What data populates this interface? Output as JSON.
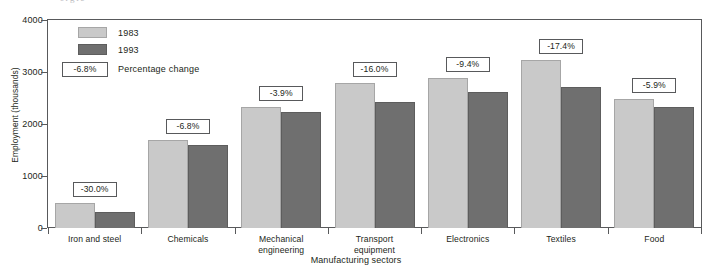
{
  "chart_data": {
    "type": "bar",
    "title": "",
    "xlabel": "Manufacturing sectors",
    "ylabel": "Employment (thousands)",
    "ylim": [
      0,
      4000
    ],
    "yticks": [
      0,
      1000,
      2000,
      3000,
      4000
    ],
    "ytick_labels": [
      "0",
      "1000",
      "2000",
      "3000",
      "4000"
    ],
    "grid": false,
    "legend_position": "inside-top-left",
    "categories": [
      "Iron and steel",
      "Chemicals",
      "Mechanical engineering",
      "Transport equipment",
      "Electronics",
      "Textiles",
      "Food"
    ],
    "series": [
      {
        "name": "1983",
        "color": "#c9c9c9",
        "values": [
          480,
          1700,
          2320,
          2790,
          2880,
          3240,
          2480
        ]
      },
      {
        "name": "1993",
        "color": "#6f6f6f",
        "values": [
          310,
          1590,
          2230,
          2420,
          2620,
          2710,
          2330
        ]
      }
    ],
    "annotations": [
      "-30.0%",
      "-6.8%",
      "-3.9%",
      "-16.0%",
      "-9.4%",
      "-17.4%",
      "-5.9%"
    ],
    "annotation_label": "Percentage change",
    "annotation_sample": "-6.8%"
  },
  "legend": {
    "items": [
      {
        "label": "1983",
        "color": "#c9c9c9"
      },
      {
        "label": "1993",
        "color": "#6f6f6f"
      }
    ],
    "pct_sample": "-6.8%",
    "pct_label": "Percentage change"
  },
  "axes": {
    "ylabel": "Employment (thousands)",
    "xlabel": "Manufacturing sectors",
    "ytick_labels": [
      "4000",
      "3000",
      "2000",
      "1000",
      "0"
    ],
    "category_lines": [
      [
        "Iron and steel"
      ],
      [
        "Chemicals"
      ],
      [
        "Mechanical",
        "engineering"
      ],
      [
        "Transport",
        "equipment"
      ],
      [
        "Electronics"
      ],
      [
        "Textiles"
      ],
      [
        "Food"
      ]
    ]
  },
  "page": {
    "top_cropped_text": "ergic  "
  },
  "colors": {
    "frame": "#58595b",
    "text": "#231f20",
    "bar_1983": "#c9c9c9",
    "bar_1993": "#6f6f6f",
    "background": "#ffffff"
  }
}
